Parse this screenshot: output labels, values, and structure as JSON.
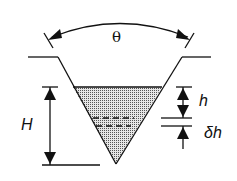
{
  "diagram": {
    "labels": {
      "angle": "θ",
      "total_depth": "H",
      "depth": "h",
      "increment": "δh"
    },
    "colors": {
      "stroke": "#111111",
      "fill": "#bdbdbd"
    }
  }
}
